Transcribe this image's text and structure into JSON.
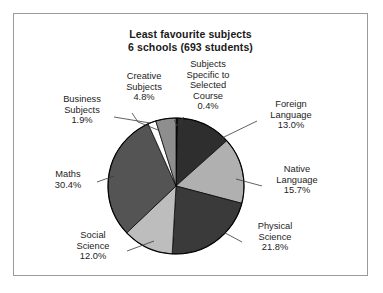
{
  "chart": {
    "title_line1": "Least favourite subjects",
    "title_line2": "6 schools (693 students)"
  },
  "labels": {
    "creative": {
      "l1": "Creative",
      "l2": "Subjects",
      "pct": "4.8%"
    },
    "specific": {
      "l1": "Subjects",
      "l2": "Specific to",
      "l3": "Selected",
      "l4": "Course",
      "pct": "0.4%"
    },
    "business": {
      "l1": "Business",
      "l2": "Subjects",
      "pct": "1.9%"
    },
    "foreign": {
      "l1": "Foreign",
      "l2": "Language",
      "pct": "13.0%"
    },
    "native": {
      "l1": "Native",
      "l2": "Language",
      "pct": "15.7%"
    },
    "physical": {
      "l1": "Physical",
      "l2": "Science",
      "pct": "21.8%"
    },
    "social": {
      "l1": "Social",
      "l2": "Science",
      "pct": "12.0%"
    },
    "maths": {
      "l1": "Maths",
      "pct": "30.4%"
    }
  },
  "chart_data": {
    "type": "pie",
    "title": "Least favourite subjects 6 schools (693 students)",
    "total_students": 693,
    "schools": 6,
    "legend_position": "callout-labels",
    "categories": [
      "Subjects Specific to Selected Course",
      "Foreign Language",
      "Native Language",
      "Physical Science",
      "Social Science",
      "Maths",
      "Business Subjects",
      "Creative Subjects"
    ],
    "values": [
      0.4,
      13.0,
      15.7,
      21.8,
      12.0,
      30.4,
      1.9,
      4.8
    ],
    "unit": "percent",
    "start_angle_deg": 0,
    "direction": "clockwise",
    "slice_colors": [
      "#1c1c1c",
      "#2e2e2e",
      "#b0b0b0",
      "#3a3a3a",
      "#bdbdbd",
      "#545454",
      "#ffffff",
      "#8e8e8e"
    ]
  }
}
